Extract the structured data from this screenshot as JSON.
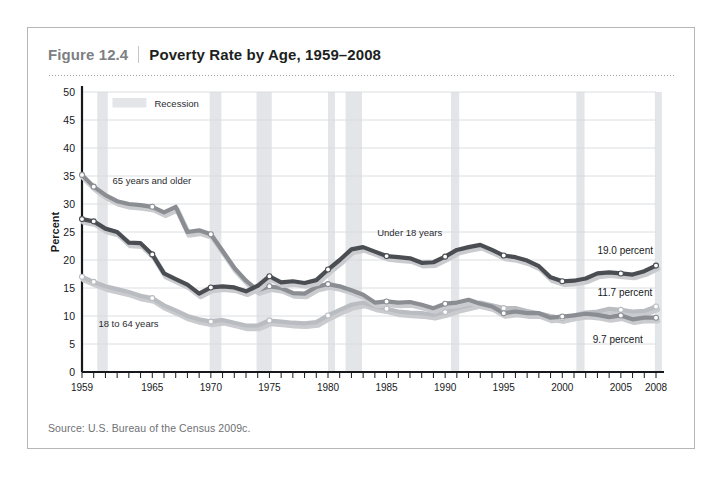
{
  "figure": {
    "number": "Figure 12.4",
    "title": "Poverty Rate by Age, 1959–2008",
    "source": "Source:  U.S. Bureau of the Census 2009c."
  },
  "legend": {
    "recession_label": "Recession",
    "recession_color": "#e3e5e8"
  },
  "annotations": {
    "under18": "Under 18 years",
    "age18to64": "18 to 64 years",
    "age65plus": "65 years and older",
    "end_under18": "19.0 percent",
    "end_18to64": "11.7 percent",
    "end_65plus": "9.7 percent"
  },
  "chart_data": {
    "type": "line",
    "title": "Poverty Rate by Age, 1959–2008",
    "xlabel": "",
    "ylabel": "Percent",
    "xlim": [
      1959,
      2008
    ],
    "ylim": [
      0,
      50
    ],
    "yticks": [
      0,
      5,
      10,
      15,
      20,
      25,
      30,
      35,
      40,
      45,
      50
    ],
    "xticks_labeled": [
      1959,
      1965,
      1970,
      1975,
      1980,
      1985,
      1990,
      1995,
      2000,
      2005,
      2008
    ],
    "grid": true,
    "legend_position": "inside-top-left",
    "colors": {
      "under18": "#4a4d52",
      "age18to64": "#b9bcc0",
      "age65plus": "#8a8d92"
    },
    "x": [
      1959,
      1960,
      1961,
      1962,
      1963,
      1964,
      1965,
      1966,
      1967,
      1968,
      1969,
      1970,
      1971,
      1972,
      1973,
      1974,
      1975,
      1976,
      1977,
      1978,
      1979,
      1980,
      1981,
      1982,
      1983,
      1984,
      1985,
      1986,
      1987,
      1988,
      1989,
      1990,
      1991,
      1992,
      1993,
      1994,
      1995,
      1996,
      1997,
      1998,
      1999,
      2000,
      2001,
      2002,
      2003,
      2004,
      2005,
      2006,
      2007,
      2008
    ],
    "series": [
      {
        "name": "Under 18 years",
        "key": "under18",
        "color": "#4a4d52",
        "values": [
          27.3,
          26.9,
          25.6,
          25.0,
          23.1,
          23.0,
          21.0,
          17.6,
          16.6,
          15.6,
          14.0,
          15.1,
          15.3,
          15.1,
          14.4,
          15.4,
          17.1,
          16.0,
          16.2,
          15.9,
          16.4,
          18.3,
          20.0,
          21.9,
          22.3,
          21.5,
          20.7,
          20.5,
          20.3,
          19.5,
          19.6,
          20.6,
          21.8,
          22.3,
          22.7,
          21.8,
          20.8,
          20.5,
          19.9,
          18.9,
          16.9,
          16.2,
          16.3,
          16.7,
          17.6,
          17.8,
          17.6,
          17.4,
          18.0,
          19.0
        ]
      },
      {
        "name": "18 to 64 years",
        "key": "age18to64",
        "color": "#b9bcc0",
        "values": [
          17.0,
          16.1,
          15.3,
          14.8,
          14.3,
          13.6,
          13.2,
          11.9,
          11.0,
          10.0,
          9.4,
          9.0,
          9.3,
          8.8,
          8.3,
          8.3,
          9.2,
          9.0,
          8.8,
          8.7,
          8.9,
          10.1,
          11.1,
          12.0,
          12.4,
          11.7,
          11.3,
          10.8,
          10.6,
          10.5,
          10.2,
          10.7,
          11.4,
          11.9,
          12.4,
          11.9,
          11.4,
          11.4,
          10.9,
          10.5,
          10.0,
          9.6,
          10.1,
          10.6,
          10.8,
          11.3,
          11.1,
          10.8,
          10.9,
          11.7
        ]
      },
      {
        "name": "65 years and older",
        "key": "age65plus",
        "color": "#8a8d92",
        "values": [
          35.2,
          33.1,
          31.6,
          30.5,
          30.0,
          29.8,
          29.5,
          28.5,
          29.5,
          25.0,
          25.3,
          24.6,
          21.6,
          18.6,
          16.3,
          14.6,
          15.3,
          15.0,
          14.1,
          14.0,
          15.2,
          15.7,
          15.3,
          14.6,
          13.8,
          12.4,
          12.6,
          12.4,
          12.5,
          12.0,
          11.4,
          12.2,
          12.4,
          12.9,
          12.2,
          11.7,
          10.5,
          10.8,
          10.5,
          10.5,
          9.7,
          9.9,
          10.1,
          10.4,
          10.2,
          9.8,
          10.1,
          9.4,
          9.7,
          9.7
        ]
      }
    ],
    "recession_bands": [
      {
        "start": 1960.3,
        "end": 1961.2
      },
      {
        "start": 1969.9,
        "end": 1970.9
      },
      {
        "start": 1973.9,
        "end": 1975.2
      },
      {
        "start": 1980.0,
        "end": 1980.6
      },
      {
        "start": 1981.5,
        "end": 1982.9
      },
      {
        "start": 1990.5,
        "end": 1991.2
      },
      {
        "start": 2001.2,
        "end": 2001.9
      },
      {
        "start": 2007.9,
        "end": 2008.5
      }
    ]
  }
}
